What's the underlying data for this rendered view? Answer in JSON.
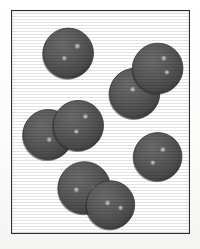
{
  "figure": {
    "title": "",
    "caption": "",
    "frame": {
      "x": 11,
      "y": 10,
      "width": 179,
      "height": 224,
      "border_color": "#2e2e2e",
      "border_width": 1.5,
      "background_color": "#ffffff"
    },
    "page_background_color": "#fdfdfc"
  },
  "diagram_data": {
    "type": "particle-model",
    "subject": "molecular model of a gas showing single atoms and diatomic molecules",
    "sphere_fill_color": "#5a5a5a",
    "sphere_rim_color": "#3b3b3b",
    "sphere_shadow_color": "#2a2a2a",
    "highlight_color": "#d8d8d8",
    "units": "pixels, origin at top-left of frame interior",
    "particle_counts": {
      "total_spheres": 8,
      "single_atoms": 2,
      "diatomic_molecules": 3
    },
    "particles": [
      {
        "id": "single-atom-top-left",
        "kind": "single",
        "spheres": [
          {
            "cx": 56,
            "cy": 42,
            "r": 25,
            "highlights": [
              {
                "x": 9,
                "y": -7,
                "r": 3.4
              },
              {
                "x": -4,
                "y": 5,
                "r": 3.0
              }
            ]
          }
        ]
      },
      {
        "id": "diatomic-top-right",
        "kind": "pair",
        "spheres": [
          {
            "cx": 122,
            "cy": 82,
            "r": 25,
            "highlights": [
              {
                "x": -2,
                "y": -4,
                "r": 3.2
              }
            ]
          },
          {
            "cx": 145,
            "cy": 57,
            "r": 25,
            "highlights": [
              {
                "x": 6,
                "y": -10,
                "r": 3.2
              },
              {
                "x": 9,
                "y": 4,
                "r": 3.0
              }
            ]
          }
        ]
      },
      {
        "id": "diatomic-middle-left",
        "kind": "pair",
        "spheres": [
          {
            "cx": 36,
            "cy": 123,
            "r": 25,
            "highlights": [
              {
                "x": 1,
                "y": 5,
                "r": 3.2
              }
            ]
          },
          {
            "cx": 66,
            "cy": 114,
            "r": 25,
            "highlights": [
              {
                "x": 7,
                "y": -9,
                "r": 3.2
              },
              {
                "x": -2,
                "y": 6,
                "r": 3.0
              }
            ]
          }
        ]
      },
      {
        "id": "single-atom-middle-right",
        "kind": "single",
        "spheres": [
          {
            "cx": 145,
            "cy": 145,
            "r": 24,
            "highlights": [
              {
                "x": 5,
                "y": -7,
                "r": 3.2
              },
              {
                "x": -5,
                "y": 6,
                "r": 3.0
              }
            ]
          }
        ]
      },
      {
        "id": "diatomic-bottom",
        "kind": "pair",
        "spheres": [
          {
            "cx": 72,
            "cy": 176,
            "r": 26,
            "highlights": [
              {
                "x": -8,
                "y": 2,
                "r": 3.2
              },
              {
                "x": 10,
                "y": 1,
                "r": 3.0
              }
            ]
          },
          {
            "cx": 98,
            "cy": 193,
            "r": 24,
            "highlights": [
              {
                "x": -3,
                "y": -2,
                "r": 3.2
              },
              {
                "x": 10,
                "y": 3,
                "r": 3.0
              }
            ]
          }
        ]
      }
    ]
  }
}
